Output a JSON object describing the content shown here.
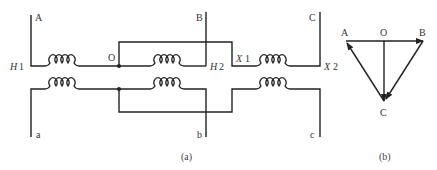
{
  "figure": {
    "panel_a": {
      "caption": "(a)",
      "terminals_top": {
        "A": "A",
        "B": "B",
        "C": "C"
      },
      "terminals_bottom": {
        "a": "a",
        "b": "b",
        "c": "c"
      },
      "node_labels": {
        "H1": "H",
        "H1_num": "1",
        "H2": "H",
        "H2_num": "2",
        "X1": "X",
        "X1_num": "1",
        "X2": "X",
        "X2_num": "2",
        "O": "O"
      }
    },
    "panel_b": {
      "caption": "(b)",
      "vertices": {
        "A": "A",
        "O": "O",
        "B": "B",
        "C": "C"
      }
    }
  }
}
